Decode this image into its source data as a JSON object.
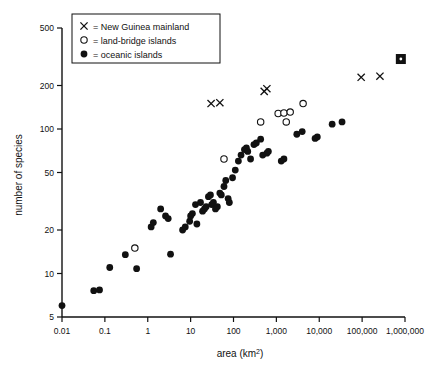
{
  "chart_data": {
    "type": "scatter",
    "title": "",
    "xlabel": "area (km2)",
    "xlabel_base": "area (km",
    "xlabel_sup": "2",
    "xlabel_close": ")",
    "ylabel": "number of species",
    "xscale": "log",
    "yscale": "log",
    "xlim": [
      0.01,
      1000000
    ],
    "ylim": [
      5,
      500
    ],
    "grid": false,
    "legend_position": "top-left",
    "xticks": [
      0.01,
      0.1,
      1,
      10,
      100,
      1000,
      10000,
      100000,
      1000000
    ],
    "xticklabels": [
      "0.01",
      "0.1",
      "1",
      "10",
      "100",
      "1,000",
      "10,000",
      "100,000",
      "1,000,000"
    ],
    "yticks": [
      5,
      10,
      20,
      50,
      100,
      200,
      500
    ],
    "yticklabels": [
      "5",
      "10",
      "20",
      "50",
      "100",
      "200",
      "500"
    ],
    "legend": [
      {
        "marker": "x",
        "symbol": "×",
        "label": "= New Guinea mainland"
      },
      {
        "marker": "o",
        "symbol": "○",
        "label": "= land-bridge islands"
      },
      {
        "marker": "filled",
        "symbol": "●",
        "label": "= oceanic islands"
      }
    ],
    "series": [
      {
        "name": "New Guinea mainland",
        "marker": "x",
        "points": [
          [
            30,
            150
          ],
          [
            48,
            152
          ],
          [
            520,
            182
          ],
          [
            600,
            190
          ],
          [
            95000,
            228
          ],
          [
            260000,
            232
          ]
        ]
      },
      {
        "name": "New Guinea mainland (whole island)",
        "marker": "square-x",
        "points": [
          [
            800000,
            305
          ]
        ]
      },
      {
        "name": "land-bridge islands",
        "marker": "o",
        "points": [
          [
            0.5,
            15
          ],
          [
            60,
            62
          ],
          [
            430,
            112
          ],
          [
            1100,
            128
          ],
          [
            1500,
            129
          ],
          [
            2100,
            131
          ],
          [
            1700,
            112
          ],
          [
            4200,
            150
          ]
        ]
      },
      {
        "name": "oceanic islands",
        "marker": "filled",
        "points": [
          [
            0.01,
            6
          ],
          [
            0.055,
            7.6
          ],
          [
            0.075,
            7.7
          ],
          [
            0.13,
            11
          ],
          [
            0.3,
            13.5
          ],
          [
            0.55,
            10.8
          ],
          [
            1.2,
            21
          ],
          [
            1.35,
            22.5
          ],
          [
            2.0,
            28
          ],
          [
            2.6,
            25
          ],
          [
            3.0,
            24
          ],
          [
            3.4,
            13.6
          ],
          [
            6.5,
            20
          ],
          [
            7.5,
            21
          ],
          [
            9.5,
            23
          ],
          [
            10,
            25
          ],
          [
            11,
            26
          ],
          [
            13,
            30
          ],
          [
            14,
            22
          ],
          [
            17,
            31
          ],
          [
            19,
            27
          ],
          [
            21,
            28
          ],
          [
            23,
            29
          ],
          [
            26,
            34
          ],
          [
            29,
            35
          ],
          [
            31,
            30
          ],
          [
            34,
            31
          ],
          [
            38,
            28
          ],
          [
            42,
            29
          ],
          [
            48,
            36
          ],
          [
            52,
            35
          ],
          [
            60,
            40
          ],
          [
            66,
            44
          ],
          [
            75,
            33
          ],
          [
            80,
            31
          ],
          [
            95,
            46
          ],
          [
            110,
            52
          ],
          [
            130,
            60
          ],
          [
            150,
            66
          ],
          [
            180,
            72
          ],
          [
            200,
            74
          ],
          [
            215,
            70
          ],
          [
            250,
            62
          ],
          [
            300,
            78
          ],
          [
            340,
            80
          ],
          [
            430,
            85
          ],
          [
            480,
            66
          ],
          [
            600,
            68
          ],
          [
            650,
            70
          ],
          [
            1300,
            60
          ],
          [
            1500,
            62
          ],
          [
            3000,
            92
          ],
          [
            4000,
            96
          ],
          [
            8000,
            86
          ],
          [
            9000,
            88
          ],
          [
            20000,
            108
          ],
          [
            34000,
            112
          ]
        ]
      }
    ]
  }
}
